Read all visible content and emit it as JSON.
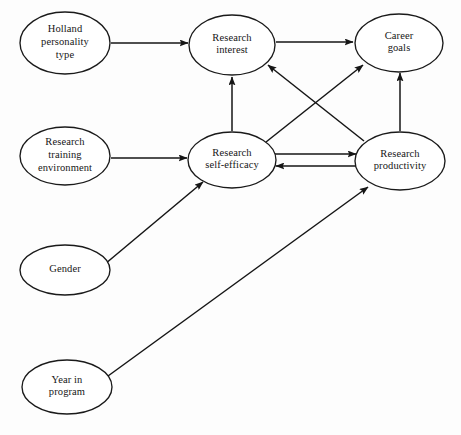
{
  "diagram": {
    "background_color": "#fdfdfd",
    "line_color": "#151515",
    "text_color": "#161616",
    "nodes": [
      {
        "id": "holland",
        "label_lines": [
          "Holland",
          "personality",
          "type"
        ],
        "cx": 65,
        "cy": 43,
        "rx": 45,
        "ry": 31
      },
      {
        "id": "research_interest",
        "label_lines": [
          "Research",
          "interest"
        ],
        "cx": 232,
        "cy": 45,
        "rx": 43,
        "ry": 30
      },
      {
        "id": "career_goals",
        "label_lines": [
          "Career",
          "goals"
        ],
        "cx": 399,
        "cy": 43,
        "rx": 44,
        "ry": 29
      },
      {
        "id": "research_training_environment",
        "label_lines": [
          "Research",
          "training",
          "environment"
        ],
        "cx": 65,
        "cy": 156,
        "rx": 45,
        "ry": 29
      },
      {
        "id": "research_self_efficacy",
        "label_lines": [
          "Research",
          "self-efficacy"
        ],
        "cx": 232,
        "cy": 160,
        "rx": 44,
        "ry": 28
      },
      {
        "id": "research_productivity",
        "label_lines": [
          "Research",
          "productivity"
        ],
        "cx": 400,
        "cy": 161,
        "rx": 45,
        "ry": 29
      },
      {
        "id": "gender",
        "label_lines": [
          "Gender"
        ],
        "cx": 65,
        "cy": 270,
        "rx": 45,
        "ry": 25
      },
      {
        "id": "year_in_program",
        "label_lines": [
          "Year in",
          "program"
        ],
        "cx": 67,
        "cy": 387,
        "rx": 45,
        "ry": 27
      }
    ],
    "edges": [
      {
        "id": "holland-to-interest",
        "from": "holland",
        "to": "research_interest",
        "x1": 111,
        "y1": 43,
        "x2": 188,
        "y2": 43
      },
      {
        "id": "interest-to-career-goals",
        "from": "research_interest",
        "to": "career_goals",
        "x1": 276,
        "y1": 42,
        "x2": 353,
        "y2": 42
      },
      {
        "id": "rte-to-self-efficacy",
        "from": "research_training_environment",
        "to": "research_self_efficacy",
        "x1": 111,
        "y1": 158,
        "x2": 187,
        "y2": 158
      },
      {
        "id": "self-efficacy-to-interest",
        "from": "research_self_efficacy",
        "to": "research_interest",
        "x1": 232,
        "y1": 131,
        "x2": 232,
        "y2": 77
      },
      {
        "id": "productivity-to-career-goals",
        "from": "research_productivity",
        "to": "career_goals",
        "x1": 400,
        "y1": 131,
        "x2": 400,
        "y2": 73
      },
      {
        "id": "self-efficacy-to-productivity",
        "from": "research_self_efficacy",
        "to": "research_productivity",
        "x1": 275,
        "y1": 154,
        "x2": 356,
        "y2": 154
      },
      {
        "id": "productivity-to-self-efficacy",
        "from": "research_productivity",
        "to": "research_self_efficacy",
        "x1": 356,
        "y1": 166,
        "x2": 276,
        "y2": 166
      },
      {
        "id": "productivity-to-interest",
        "from": "research_productivity",
        "to": "research_interest",
        "x1": 364,
        "y1": 141,
        "x2": 268,
        "y2": 65
      },
      {
        "id": "self-efficacy-to-career-goals",
        "from": "research_self_efficacy",
        "to": "career_goals",
        "x1": 266,
        "y1": 142,
        "x2": 363,
        "y2": 65
      },
      {
        "id": "gender-to-self-efficacy",
        "from": "gender",
        "to": "research_self_efficacy",
        "x1": 105,
        "y1": 264,
        "x2": 203,
        "y2": 182
      },
      {
        "id": "year-to-productivity",
        "from": "year_in_program",
        "to": "research_productivity",
        "x1": 108,
        "y1": 376,
        "x2": 368,
        "y2": 187
      }
    ]
  }
}
